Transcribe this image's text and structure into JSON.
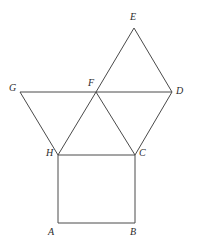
{
  "figure": {
    "canvas": {
      "width": 197,
      "height": 241,
      "background": "#ffffff"
    },
    "style": {
      "stroke_color": "#4a4a4a",
      "stroke_width": 1,
      "label_color": "#2b2b2b",
      "label_font_size": 10
    },
    "points": {
      "A": {
        "label": "A",
        "x": 58,
        "y": 223,
        "label_x": 48,
        "label_y": 227
      },
      "B": {
        "label": "B",
        "x": 135,
        "y": 223,
        "label_x": 130,
        "label_y": 227
      },
      "C": {
        "label": "C",
        "x": 135,
        "y": 155,
        "label_x": 139,
        "label_y": 148
      },
      "D": {
        "label": "D",
        "x": 172,
        "y": 92,
        "label_x": 176,
        "label_y": 86
      },
      "E": {
        "label": "E",
        "x": 134,
        "y": 28,
        "label_x": 130,
        "label_y": 12
      },
      "F": {
        "label": "F",
        "x": 96,
        "y": 92,
        "label_x": 88,
        "label_y": 78
      },
      "G": {
        "label": "G",
        "x": 20,
        "y": 92,
        "label_x": 9,
        "label_y": 83
      },
      "H": {
        "label": "H",
        "x": 58,
        "y": 155,
        "label_x": 46,
        "label_y": 148
      }
    },
    "edges": [
      {
        "name": "edge-A-B",
        "from": "A",
        "to": "B"
      },
      {
        "name": "edge-B-C",
        "from": "B",
        "to": "C"
      },
      {
        "name": "edge-C-H",
        "from": "C",
        "to": "H"
      },
      {
        "name": "edge-H-A",
        "from": "H",
        "to": "A"
      },
      {
        "name": "edge-G-F",
        "from": "G",
        "to": "F"
      },
      {
        "name": "edge-F-D",
        "from": "F",
        "to": "D"
      },
      {
        "name": "edge-G-H",
        "from": "G",
        "to": "H"
      },
      {
        "name": "edge-H-F",
        "from": "H",
        "to": "F"
      },
      {
        "name": "edge-F-C",
        "from": "F",
        "to": "C"
      },
      {
        "name": "edge-C-D",
        "from": "C",
        "to": "D"
      },
      {
        "name": "edge-F-E",
        "from": "F",
        "to": "E"
      },
      {
        "name": "edge-E-D",
        "from": "E",
        "to": "D"
      }
    ],
    "shapes": [
      {
        "name": "square-ABCH",
        "vertices": [
          "A",
          "B",
          "C",
          "H"
        ]
      },
      {
        "name": "triangle-GHF",
        "vertices": [
          "G",
          "H",
          "F"
        ]
      },
      {
        "name": "triangle-HFC",
        "vertices": [
          "H",
          "F",
          "C"
        ]
      },
      {
        "name": "triangle-FCD",
        "vertices": [
          "F",
          "C",
          "D"
        ]
      },
      {
        "name": "triangle-FED",
        "vertices": [
          "F",
          "E",
          "D"
        ]
      }
    ]
  }
}
